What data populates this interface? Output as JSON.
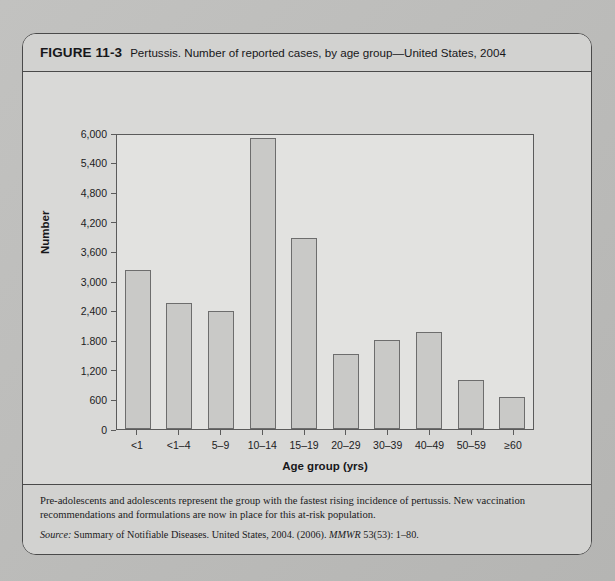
{
  "figure": {
    "label": "FIGURE 11-3",
    "title": "Pertussis. Number of reported cases, by age group—United States, 2004"
  },
  "chart_data": {
    "type": "bar",
    "title": "Pertussis. Number of reported cases, by age group—United States, 2004",
    "xlabel": "Age group (yrs)",
    "ylabel": "Number",
    "categories": [
      "<1",
      "<1–4",
      "5–9",
      "10–14",
      "15–19",
      "20–29",
      "30–39",
      "40–49",
      "50–59",
      "≥60"
    ],
    "values": [
      3230,
      2550,
      2390,
      5900,
      3880,
      1520,
      1800,
      1960,
      990,
      640
    ],
    "ylim": [
      0,
      6000
    ],
    "yticks": [
      0,
      600,
      1200,
      1800,
      2400,
      3000,
      3600,
      4200,
      4800,
      5400,
      6000
    ],
    "ytick_labels": [
      "0",
      "600",
      "1,200",
      "1.800",
      "2,400",
      "3,000",
      "3,600",
      "4,200",
      "4,800",
      "5,400",
      "6,000"
    ],
    "grid": false,
    "legend": null,
    "bar_fill": "#c9c9c7",
    "bar_stroke": "#6d6d6d"
  },
  "footnotes": [
    "*Of 25,827 cases, age was reported unknown for 655 cases.",
    "During 1990–2004, the proportion of cases reported in persons aged ≥10 years increased from 20% to 67%. In 2005, the first pertussis vaccines for",
    "persons aged ≥10 years were licensed in the United States."
  ],
  "caption": {
    "body": "Pre-adolescents and adolescents represent the group with the fastest rising incidence of pertussis. New vaccination recommendations and formulations are now in place for this at-risk population.",
    "source_label": "Source:",
    "source_text": "Summary of Notifiable Diseases. United States, 2004. (2006).",
    "source_journal": "MMWR",
    "source_citation": "53(53): 1–80."
  }
}
